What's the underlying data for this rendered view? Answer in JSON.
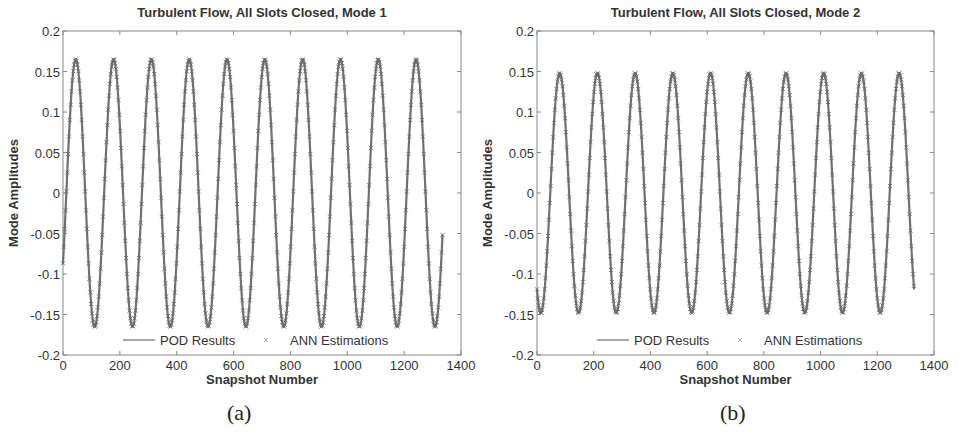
{
  "chart_data": [
    {
      "type": "line",
      "panel_label": "(a)",
      "title": "Turbulent Flow, All Slots Closed, Mode 1",
      "xlabel": "Snapshot Number",
      "ylabel": "Mode Amplitudes",
      "xlim": [
        0,
        1400
      ],
      "ylim": [
        -0.2,
        0.2
      ],
      "xticks": [
        "0",
        "200",
        "400",
        "600",
        "800",
        "1000",
        "1200",
        "1400"
      ],
      "yticks": [
        "0.2",
        "0.15",
        "0.1",
        "0.05",
        "0",
        "-0.05",
        "-0.1",
        "-0.15",
        "-0.2"
      ],
      "grid": false,
      "legend": {
        "position": "bottom-inside",
        "entries": [
          "POD Results",
          "ANN Estimations"
        ]
      },
      "series": [
        {
          "name": "POD Results",
          "style": "line",
          "amplitude": 0.165,
          "period": 133,
          "phase_first_peak": 45,
          "x_start": 0,
          "x_end": 1335,
          "y_start": -0.09,
          "y_end": -0.075
        },
        {
          "name": "ANN Estimations",
          "style": "x-marker",
          "amplitude": 0.165,
          "period": 133,
          "phase_first_peak": 45,
          "x_start": 0,
          "x_end": 1335
        }
      ],
      "peaks_x": [
        45,
        178,
        311,
        444,
        577,
        710,
        843,
        976,
        1109,
        1242
      ],
      "troughs_x": [
        112,
        245,
        378,
        511,
        644,
        777,
        910,
        1043,
        1176,
        1309
      ]
    },
    {
      "type": "line",
      "panel_label": "(b)",
      "title": "Turbulent Flow, All Slots Closed, Mode 2",
      "xlabel": "Snapshot Number",
      "ylabel": "Mode Amplitudes",
      "xlim": [
        0,
        1400
      ],
      "ylim": [
        -0.2,
        0.2
      ],
      "xticks": [
        "0",
        "200",
        "400",
        "600",
        "800",
        "1000",
        "1200",
        "1400"
      ],
      "yticks": [
        "0.2",
        "0.15",
        "0.1",
        "0.05",
        "0",
        "-0.05",
        "-0.1",
        "-0.15",
        "-0.2"
      ],
      "grid": false,
      "legend": {
        "position": "bottom-inside",
        "entries": [
          "POD Results",
          "ANN Estimations"
        ]
      },
      "series": [
        {
          "name": "POD Results",
          "style": "line",
          "amplitude": 0.148,
          "period": 133,
          "phase_first_peak": 80,
          "x_start": 0,
          "x_end": 1330,
          "y_start": -0.13,
          "y_end": -0.128
        },
        {
          "name": "ANN Estimations",
          "style": "x-marker",
          "amplitude": 0.148,
          "period": 133,
          "phase_first_peak": 80,
          "x_start": 0,
          "x_end": 1330
        }
      ],
      "peaks_x": [
        80,
        213,
        346,
        479,
        612,
        745,
        878,
        1011,
        1144,
        1277
      ],
      "troughs_x": [
        14,
        147,
        280,
        413,
        546,
        679,
        812,
        945,
        1078,
        1211
      ]
    }
  ],
  "colors": {
    "line": "#707070",
    "marker": "#6a6a6a",
    "axis": "#888888",
    "text": "#333333"
  }
}
